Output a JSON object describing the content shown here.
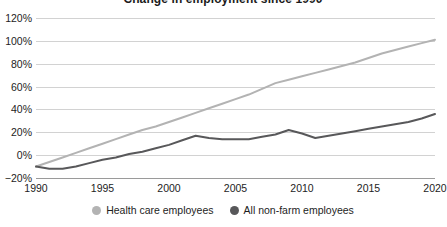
{
  "chart_data": {
    "type": "line",
    "title": "Change in employment since 1990",
    "xlabel": "",
    "ylabel": "",
    "xlim": [
      1990,
      2020
    ],
    "ylim": [
      -20,
      120
    ],
    "ytick_labels": [
      "120%",
      "100%",
      "80%",
      "60%",
      "40%",
      "20%",
      "0%",
      "−20%"
    ],
    "ytick_values": [
      120,
      100,
      80,
      60,
      40,
      20,
      0,
      -20
    ],
    "xtick_labels": [
      "1990",
      "1995",
      "2000",
      "2005",
      "2010",
      "2015",
      "2020"
    ],
    "xtick_values": [
      1990,
      1995,
      2000,
      2005,
      2010,
      2015,
      2020
    ],
    "grid": true,
    "legend_position": "bottom-center",
    "x": [
      1990,
      1991,
      1992,
      1993,
      1994,
      1995,
      1996,
      1997,
      1998,
      1999,
      2000,
      2001,
      2002,
      2003,
      2004,
      2005,
      2006,
      2007,
      2008,
      2009,
      2010,
      2011,
      2012,
      2013,
      2014,
      2015,
      2016,
      2017,
      2018,
      2019,
      2020
    ],
    "series": [
      {
        "name": "Health care employees",
        "color": "#b3b3b3",
        "values": [
          -10,
          -6,
          -2,
          2,
          6,
          10,
          14,
          18,
          22,
          25,
          29,
          33,
          37,
          41,
          45,
          49,
          53,
          58,
          63,
          66,
          69,
          72,
          75,
          78,
          81,
          85,
          89,
          92,
          95,
          98,
          101
        ]
      },
      {
        "name": "All non-farm employees",
        "color": "#58585a",
        "values": [
          -10,
          -12,
          -12,
          -10,
          -7,
          -4,
          -2,
          1,
          3,
          6,
          9,
          13,
          17,
          15,
          14,
          14,
          14,
          16,
          18,
          22,
          19,
          15,
          17,
          19,
          21,
          23,
          25,
          27,
          29,
          32,
          36
        ]
      }
    ]
  },
  "legend": {
    "items": [
      {
        "label": "Health care employees",
        "color": "#b3b3b3"
      },
      {
        "label": "All non-farm employees",
        "color": "#58585a"
      }
    ]
  }
}
